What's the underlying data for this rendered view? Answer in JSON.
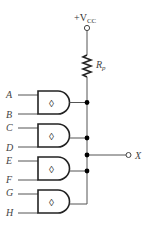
{
  "supply": {
    "label_prefix": "+V",
    "label_sub": "CC"
  },
  "resistor": {
    "label_main": "R",
    "label_sub": "p"
  },
  "output": {
    "label": "X"
  },
  "gates": [
    {
      "symbol": "◊",
      "inputs": [
        "A",
        "B"
      ]
    },
    {
      "symbol": "◊",
      "inputs": [
        "C",
        "D"
      ]
    },
    {
      "symbol": "◊",
      "inputs": [
        "E",
        "F"
      ]
    },
    {
      "symbol": "◊",
      "inputs": [
        "G",
        "H"
      ]
    }
  ]
}
